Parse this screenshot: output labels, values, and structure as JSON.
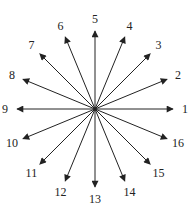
{
  "diagram": {
    "type": "radial-arrows",
    "center": [
      95,
      109
    ],
    "arrow_length": 78,
    "label_radius": 90,
    "stroke_color": "#222222",
    "arrows": [
      {
        "label": "1",
        "angle_deg": 0
      },
      {
        "label": "2",
        "angle_deg": 22.5
      },
      {
        "label": "3",
        "angle_deg": 45
      },
      {
        "label": "4",
        "angle_deg": 67.5
      },
      {
        "label": "5",
        "angle_deg": 90
      },
      {
        "label": "6",
        "angle_deg": 112.5
      },
      {
        "label": "7",
        "angle_deg": 135
      },
      {
        "label": "8",
        "angle_deg": 157.5
      },
      {
        "label": "9",
        "angle_deg": 180
      },
      {
        "label": "10",
        "angle_deg": 202.5
      },
      {
        "label": "11",
        "angle_deg": 225
      },
      {
        "label": "12",
        "angle_deg": 247.5
      },
      {
        "label": "13",
        "angle_deg": 270
      },
      {
        "label": "14",
        "angle_deg": 292.5
      },
      {
        "label": "15",
        "angle_deg": 315
      },
      {
        "label": "16",
        "angle_deg": 337.5
      }
    ]
  }
}
